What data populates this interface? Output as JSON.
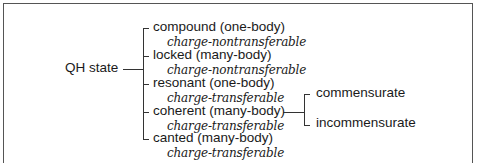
{
  "diagram": {
    "root": "QH state",
    "children": [
      {
        "label": "compound (one-body)",
        "sublabel": "charge-nontransferable"
      },
      {
        "label": "locked (many-body)",
        "sublabel": "charge-nontransferable"
      },
      {
        "label": "resonant (one-body)",
        "sublabel": "charge-transferable"
      },
      {
        "label": "coherent (many-body)",
        "sublabel": "charge-transferable",
        "children": [
          {
            "label": "commensurate"
          },
          {
            "label": "incommensurate"
          }
        ]
      },
      {
        "label": "canted (many-body)",
        "sublabel": "charge-transferable"
      }
    ]
  }
}
